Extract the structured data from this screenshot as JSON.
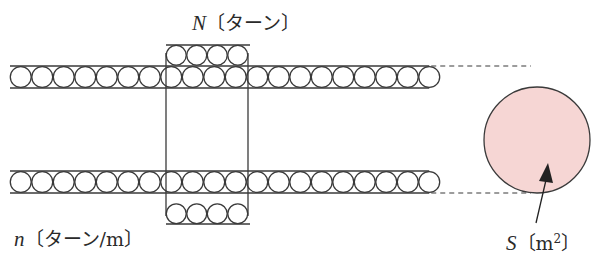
{
  "labels": {
    "N": {
      "var": "N",
      "unit": "〔ターン〕"
    },
    "n": {
      "var": "n",
      "unit": "〔ターン/m〕"
    },
    "S": {
      "var": "S",
      "unit_open": "〔m",
      "unit_sup": "2",
      "unit_close": "〕"
    }
  },
  "colors": {
    "stroke": "#3a3a3a",
    "cross_section_fill": "#f6d6d4",
    "background": "#ffffff"
  },
  "geometry": {
    "winding_circle_diameter": 21.5,
    "top_row": {
      "y_top": 66,
      "y_bottom": 88,
      "x_start": 10,
      "count": 20
    },
    "bottom_row": {
      "y_top": 171,
      "y_bottom": 193,
      "x_start": 10,
      "count": 20
    },
    "coil_box": {
      "x_left": 166,
      "x_right": 248,
      "y_top": 45,
      "y_bottom": 224,
      "layer_count": 4
    },
    "cross_section": {
      "cx": 537,
      "cy": 140,
      "r": 53
    }
  }
}
